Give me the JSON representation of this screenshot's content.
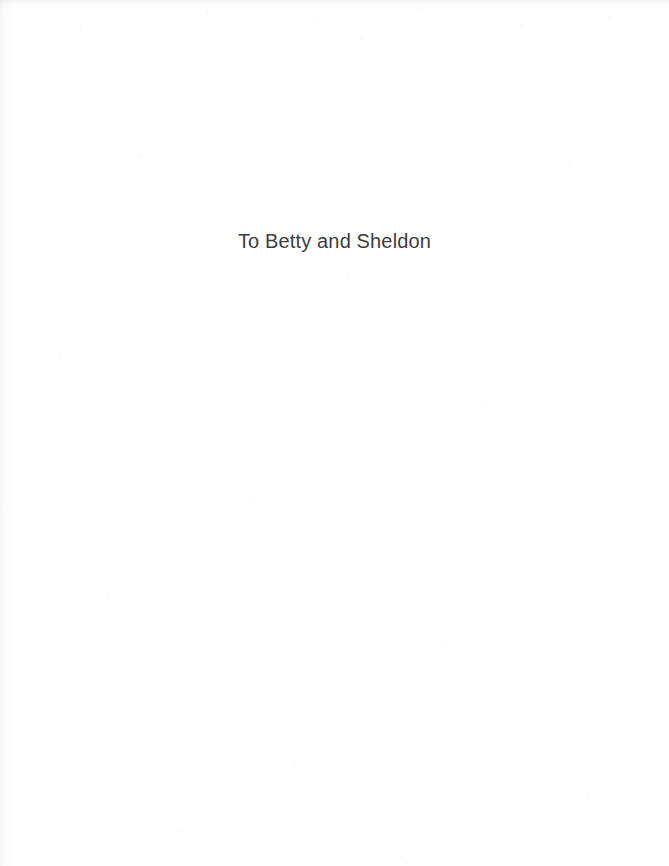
{
  "page": {
    "kind": "book-dedication-page",
    "background_color": "#ffffff",
    "width": 669,
    "height": 866
  },
  "dedication": {
    "text": "To Betty and Sheldon",
    "color": "#3d3d3d",
    "alignment": "center",
    "font_size_px": 20
  },
  "artifacts": {
    "gutter_tint_color": "#787a7d",
    "speckle_color": "#a0a0a5"
  }
}
